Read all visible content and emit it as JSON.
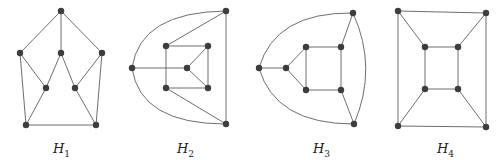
{
  "graphs": [
    {
      "id": "H1",
      "label_main": "H",
      "label_sub": "1",
      "label_pos": [
        53,
        141
      ],
      "nodes": [
        [
          61,
          11
        ],
        [
          20,
          53
        ],
        [
          61,
          53
        ],
        [
          102,
          53
        ],
        [
          46,
          88
        ],
        [
          75,
          88
        ],
        [
          26,
          125
        ],
        [
          96,
          125
        ]
      ],
      "edges": [
        [
          0,
          1
        ],
        [
          0,
          2
        ],
        [
          0,
          3
        ],
        [
          1,
          4
        ],
        [
          1,
          6
        ],
        [
          2,
          4
        ],
        [
          2,
          5
        ],
        [
          3,
          5
        ],
        [
          3,
          7
        ],
        [
          4,
          6
        ],
        [
          5,
          7
        ],
        [
          6,
          7
        ]
      ],
      "arcs": []
    },
    {
      "id": "H2",
      "label_main": "H",
      "label_sub": "2",
      "label_pos": [
        177,
        141
      ],
      "nodes": [
        [
          226,
          11
        ],
        [
          132,
          68
        ],
        [
          166,
          46
        ],
        [
          208,
          46
        ],
        [
          187,
          68
        ],
        [
          166,
          88
        ],
        [
          208,
          88
        ],
        [
          226,
          124
        ]
      ],
      "edges": [
        [
          0,
          7
        ],
        [
          0,
          2
        ],
        [
          7,
          5
        ],
        [
          1,
          4
        ],
        [
          2,
          3
        ],
        [
          2,
          5
        ],
        [
          3,
          6
        ],
        [
          5,
          6
        ],
        [
          4,
          3
        ],
        [
          4,
          6
        ]
      ],
      "arcs": [
        "M 132 68 Q 140 12 226 11",
        "M 132 68 Q 140 124 226 124"
      ]
    },
    {
      "id": "H3",
      "label_main": "H",
      "label_sub": "3",
      "label_pos": [
        313,
        141
      ],
      "nodes": [
        [
          353,
          13
        ],
        [
          259,
          68
        ],
        [
          286,
          68
        ],
        [
          306,
          47
        ],
        [
          341,
          47
        ],
        [
          306,
          90
        ],
        [
          341,
          90
        ],
        [
          354,
          124
        ]
      ],
      "edges": [
        [
          1,
          2
        ],
        [
          2,
          3
        ],
        [
          2,
          5
        ],
        [
          3,
          4
        ],
        [
          3,
          5
        ],
        [
          4,
          6
        ],
        [
          5,
          6
        ],
        [
          4,
          0
        ],
        [
          6,
          7
        ]
      ],
      "arcs": [
        "M 259 68 Q 275 12 353 13",
        "M 259 68 Q 275 124 354 124",
        "M 353 13 Q 378 68 354 124"
      ]
    },
    {
      "id": "H4",
      "label_main": "H",
      "label_sub": "4",
      "label_pos": [
        437,
        141
      ],
      "nodes": [
        [
          398,
          11
        ],
        [
          486,
          13
        ],
        [
          398,
          126
        ],
        [
          486,
          127
        ],
        [
          425,
          47
        ],
        [
          458,
          47
        ],
        [
          425,
          89
        ],
        [
          458,
          89
        ]
      ],
      "edges": [
        [
          0,
          1
        ],
        [
          0,
          2
        ],
        [
          1,
          3
        ],
        [
          2,
          3
        ],
        [
          4,
          5
        ],
        [
          4,
          6
        ],
        [
          5,
          7
        ],
        [
          6,
          7
        ],
        [
          0,
          4
        ],
        [
          1,
          5
        ],
        [
          2,
          6
        ],
        [
          3,
          7
        ]
      ],
      "arcs": []
    }
  ],
  "colors": {
    "edge": "#6e6e6e",
    "node": "#3d3d3d",
    "background": "#ffffff"
  },
  "node_radius": 3.2
}
